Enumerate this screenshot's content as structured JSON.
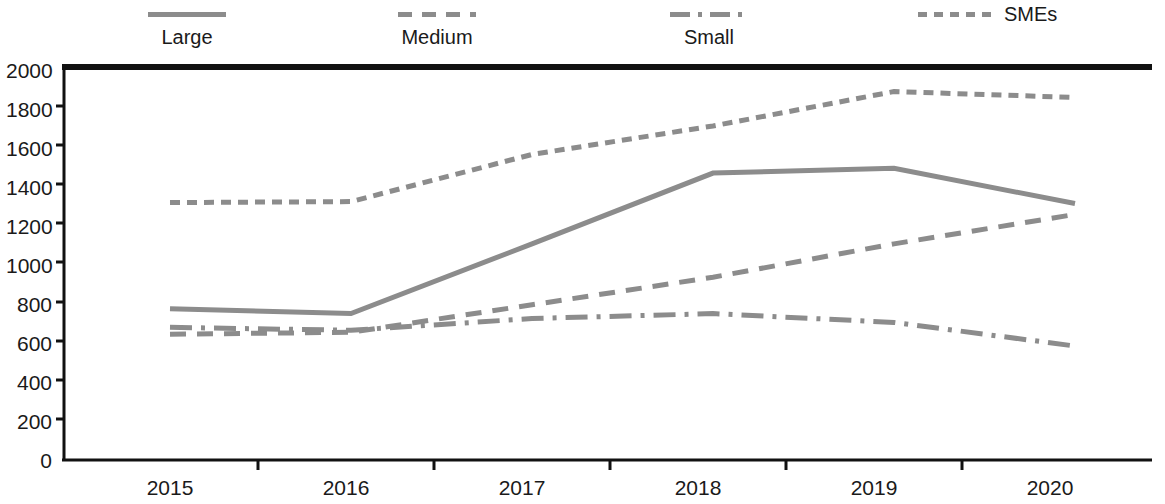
{
  "chart_data": {
    "type": "line",
    "title": "",
    "subtitle": "",
    "xlabel": "",
    "ylabel": "",
    "categories": [
      "2015",
      "2016",
      "2017",
      "2018",
      "2019",
      "2020"
    ],
    "x": [
      2015,
      2016,
      2017,
      2018,
      2019,
      2020
    ],
    "ylim": [
      0,
      2000
    ],
    "ytick_values": [
      0,
      200,
      400,
      600,
      800,
      1000,
      1200,
      1400,
      1600,
      1800,
      2000
    ],
    "ytick_labels": [
      "0",
      "200",
      "400",
      "600",
      "800",
      "1000",
      "1200",
      "1400",
      "1600",
      "1800",
      "2000"
    ],
    "grid": false,
    "legend_position": "top",
    "series": [
      {
        "name": "Large",
        "line_style": "solid",
        "color": "#8c8c8c",
        "values": [
          770,
          745,
          1100,
          1460,
          1485,
          1305
        ]
      },
      {
        "name": "Medium",
        "line_style": "dashed",
        "color": "#8c8c8c",
        "values": [
          640,
          650,
          790,
          930,
          1100,
          1250
        ]
      },
      {
        "name": "Small",
        "line_style": "dash-dot",
        "color": "#8c8c8c",
        "values": [
          675,
          660,
          720,
          745,
          700,
          580
        ]
      },
      {
        "name": "SMEs",
        "line_style": "dotted",
        "color": "#8c8c8c",
        "values": [
          1310,
          1315,
          1555,
          1700,
          1875,
          1845
        ]
      }
    ]
  },
  "legend": {
    "items": [
      {
        "label": "Large",
        "style": "solid",
        "layout": "below"
      },
      {
        "label": "Medium",
        "style": "dashed",
        "layout": "below"
      },
      {
        "label": "Small",
        "style": "dash-dot",
        "layout": "below"
      },
      {
        "label": "SMEs",
        "style": "dotted",
        "layout": "inline"
      }
    ]
  },
  "axes": {
    "y_labels": [
      "2000",
      "1800",
      "1600",
      "1400",
      "1200",
      "1000",
      "800",
      "600",
      "400",
      "200",
      "0"
    ],
    "x_labels": [
      "2015",
      "2016",
      "2017",
      "2018",
      "2019",
      "2020"
    ]
  },
  "colors": {
    "line": "#8c8c8c",
    "axis": "#111111",
    "text": "#1a1a1a",
    "background": "#ffffff"
  }
}
